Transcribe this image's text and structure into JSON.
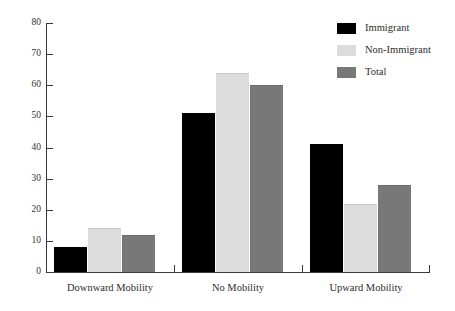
{
  "chart_data": {
    "type": "bar",
    "title": "",
    "subtitle": "",
    "xlabel": "",
    "ylabel": "",
    "categories": [
      "Downward Mobility",
      "No Mobility",
      "Upward Mobility"
    ],
    "series": [
      {
        "name": "Immigrant",
        "color": "#000000",
        "values": [
          8,
          51,
          41
        ]
      },
      {
        "name": "Non-Immigrant",
        "color": "#dcdcdc",
        "values": [
          14,
          64,
          22
        ]
      },
      {
        "name": "Total",
        "color": "#787878",
        "values": [
          12,
          60,
          28
        ]
      }
    ],
    "ylim": [
      0,
      80
    ],
    "ytick_step": 10,
    "yticks": [
      0,
      10,
      20,
      30,
      40,
      50,
      60,
      70,
      80
    ],
    "ytick_labels": [
      "0",
      "10",
      "20",
      "30",
      "40",
      "50",
      "60",
      "70",
      "80"
    ],
    "grid": false,
    "legend_position": "top-right",
    "legend_entries": [
      "Immigrant",
      "Non-Immigrant",
      "Total"
    ]
  }
}
